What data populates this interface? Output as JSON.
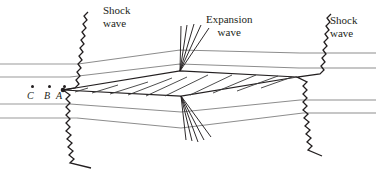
{
  "figure": {
    "type": "supersonic-diamond-airfoil-flow-diagram",
    "background_color": "#ffffff",
    "ink_color": "#231f20",
    "streamline_color": "#9a9a9a",
    "width": 376,
    "height": 177
  },
  "labels": {
    "shock_left": {
      "line1": "Shock",
      "line2": "wave"
    },
    "expansion": {
      "line1": "Expansion",
      "line2": "wave"
    },
    "shock_right": {
      "line1": "Shock",
      "line2": "wave"
    }
  },
  "points": [
    {
      "id": "C",
      "label": "C",
      "dot_x": 31,
      "dot_y": 85,
      "text_x": 27,
      "text_y": 90
    },
    {
      "id": "B",
      "label": "B",
      "dot_x": 48,
      "dot_y": 85,
      "text_x": 44,
      "text_y": 90
    },
    {
      "id": "A",
      "label": "A",
      "dot_x": 63,
      "dot_y": 85,
      "text_x": 56,
      "text_y": 90
    }
  ],
  "geometry": {
    "airfoil": {
      "leading_edge": [
        63,
        90
      ],
      "upper_apex": [
        180,
        71
      ],
      "lower_apex": [
        181,
        96
      ],
      "trailing_edge": [
        297,
        77
      ],
      "hatch_count": 9
    },
    "shock_left": {
      "top": [
        88,
        12
      ],
      "vertex": [
        63,
        90
      ],
      "bottom": [
        91,
        168
      ]
    },
    "shock_right": {
      "top": [
        331,
        14
      ],
      "vertex": [
        297,
        77
      ],
      "bottom": [
        322,
        156
      ]
    },
    "expansion_fan_upper_origin": [
      180,
      71
    ],
    "expansion_fan_lower_origin": [
      181,
      96
    ],
    "expansion_fan_rays_upper": 5,
    "expansion_fan_rays_lower": 5,
    "streamlines_upstream": 4,
    "streamlines_downstream": 4
  }
}
